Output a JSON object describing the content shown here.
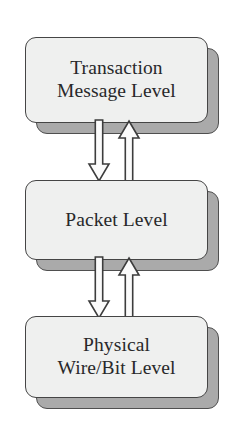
{
  "diagram": {
    "type": "layered-stack-diagram",
    "background_color": "#ffffff",
    "colors": {
      "box_fill": "#eff0ef",
      "box_border": "#454545",
      "shadow_fill": "#aaaaaa",
      "shadow_border": "#4f4f4f",
      "arrow_fill": "#fbfbfb",
      "arrow_border": "#3d3d3d",
      "text": "#28282a"
    },
    "layers": [
      {
        "id": "transaction-message-level",
        "label": "Transaction\nMessage Level",
        "line1": "Transaction",
        "line2": "Message Level",
        "box": {
          "x": 25,
          "y": 37,
          "width": 183,
          "height": 86
        },
        "shadow": {
          "x": 36,
          "y": 48,
          "width": 183,
          "height": 86
        }
      },
      {
        "id": "packet-level",
        "label": "Packet Level",
        "line1": "Packet Level",
        "line2": "",
        "box": {
          "x": 25,
          "y": 180,
          "width": 183,
          "height": 80
        },
        "shadow": {
          "x": 36,
          "y": 191,
          "width": 183,
          "height": 80
        }
      },
      {
        "id": "physical-wire-bit-level",
        "label": "Physical\nWire/Bit Level",
        "line1": "Physical",
        "line2": "Wire/Bit Level",
        "box": {
          "x": 25,
          "y": 316,
          "width": 183,
          "height": 82
        },
        "shadow": {
          "x": 36,
          "y": 327,
          "width": 183,
          "height": 82
        }
      }
    ],
    "connectors": [
      {
        "id": "connector-transaction-to-packet",
        "from": "transaction-message-level",
        "to": "packet-level",
        "down_arrow": {
          "name": "arrow-down-transaction-to-packet",
          "direction": "down",
          "x": 88,
          "y": 120,
          "width": 22,
          "height": 62
        },
        "up_arrow": {
          "name": "arrow-up-packet-to-transaction",
          "direction": "up",
          "x": 118,
          "y": 120,
          "width": 22,
          "height": 62
        }
      },
      {
        "id": "connector-packet-to-physical",
        "from": "packet-level",
        "to": "physical-wire-bit-level",
        "down_arrow": {
          "name": "arrow-down-packet-to-physical",
          "direction": "down",
          "x": 88,
          "y": 257,
          "width": 22,
          "height": 62
        },
        "up_arrow": {
          "name": "arrow-up-physical-to-packet",
          "direction": "up",
          "x": 118,
          "y": 257,
          "width": 22,
          "height": 62
        }
      }
    ]
  }
}
